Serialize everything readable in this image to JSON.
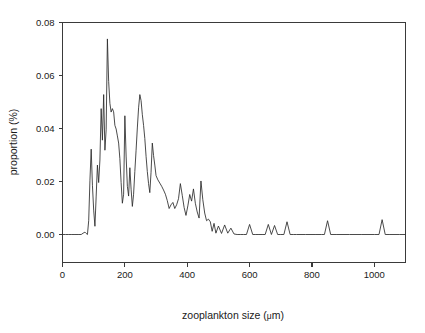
{
  "chart_data": {
    "type": "line",
    "title": "",
    "xlabel": "zooplankton size (μm)",
    "ylabel": "proportion (%)",
    "xlim": [
      0,
      1100
    ],
    "ylim": [
      0.0,
      0.08
    ],
    "grid": false,
    "legend": null,
    "x_ticks": [
      0,
      200,
      400,
      600,
      800,
      1000
    ],
    "x_tick_labels": [
      "0",
      "200",
      "400",
      "600",
      "800",
      "1000"
    ],
    "y_ticks": [
      0.0,
      0.02,
      0.04,
      0.06,
      0.08
    ],
    "y_tick_labels": [
      "0.00",
      "0.02",
      "0.04",
      "0.06",
      "0.08"
    ],
    "series": [
      {
        "name": "zooplankton size distribution",
        "color": "#2b2b2b",
        "x": [
          0,
          10,
          20,
          30,
          40,
          50,
          60,
          66,
          72,
          76,
          80,
          84,
          88,
          92,
          96,
          100,
          104,
          108,
          112,
          116,
          120,
          124,
          128,
          132,
          136,
          140,
          144,
          148,
          152,
          156,
          160,
          164,
          168,
          172,
          176,
          180,
          184,
          188,
          192,
          196,
          200,
          204,
          208,
          212,
          216,
          220,
          224,
          228,
          232,
          236,
          240,
          244,
          248,
          252,
          256,
          260,
          264,
          268,
          272,
          276,
          280,
          284,
          288,
          292,
          296,
          300,
          306,
          312,
          318,
          324,
          330,
          336,
          342,
          348,
          354,
          360,
          366,
          372,
          378,
          384,
          390,
          396,
          402,
          408,
          414,
          420,
          426,
          432,
          438,
          444,
          450,
          456,
          462,
          468,
          474,
          480,
          486,
          492,
          500,
          510,
          520,
          530,
          540,
          550,
          560,
          570,
          580,
          590,
          600,
          610,
          620,
          630,
          640,
          650,
          660,
          670,
          680,
          690,
          700,
          710,
          720,
          730,
          740,
          750,
          780,
          810,
          830,
          840,
          850,
          860,
          880,
          920,
          960,
          1000,
          1015,
          1025,
          1035,
          1050,
          1080,
          1100
        ],
        "y": [
          0.0,
          0.0,
          0.0,
          0.0,
          0.0,
          0.0,
          0.0,
          0.0005,
          0.0009,
          0.0004,
          0.0,
          0.0052,
          0.0205,
          0.0322,
          0.0186,
          0.0092,
          0.0031,
          0.0145,
          0.0262,
          0.0196,
          0.0281,
          0.0475,
          0.0356,
          0.0528,
          0.0318,
          0.0395,
          0.0738,
          0.0578,
          0.0495,
          0.0462,
          0.0475,
          0.0463,
          0.0412,
          0.0398,
          0.0372,
          0.0345,
          0.0286,
          0.0196,
          0.0118,
          0.0152,
          0.0448,
          0.0296,
          0.0182,
          0.0145,
          0.0252,
          0.0171,
          0.0106,
          0.0152,
          0.0238,
          0.0318,
          0.0402,
          0.0478,
          0.0528,
          0.0505,
          0.0452,
          0.0412,
          0.0362,
          0.0295,
          0.0238,
          0.0192,
          0.0158,
          0.0235,
          0.0345,
          0.0298,
          0.0262,
          0.0222,
          0.0206,
          0.0194,
          0.0182,
          0.0168,
          0.0152,
          0.0128,
          0.0098,
          0.0112,
          0.0121,
          0.0098,
          0.0112,
          0.0135,
          0.0192,
          0.0148,
          0.0102,
          0.0072,
          0.0108,
          0.0151,
          0.0126,
          0.0172,
          0.0118,
          0.0085,
          0.0062,
          0.0202,
          0.0131,
          0.0081,
          0.0052,
          0.0058,
          0.0048,
          0.0012,
          0.0042,
          0.0005,
          0.0032,
          0.0004,
          0.0036,
          0.0005,
          0.0024,
          0.0002,
          0.0,
          0.0,
          0.0,
          0.0,
          0.0038,
          0.0,
          0.0,
          0.0,
          0.0,
          0.0,
          0.0038,
          0.0,
          0.0034,
          0.0,
          0.0,
          0.0,
          0.0048,
          0.0,
          0.0,
          0.0,
          0.0,
          0.0,
          0.0,
          0.0,
          0.0052,
          0.0,
          0.0,
          0.0,
          0.0,
          0.0,
          0.0,
          0.0056,
          0.0,
          0.0,
          0.0,
          0.0
        ]
      }
    ]
  },
  "figure": {
    "background_color": "#ffffff",
    "axis_color": "#3a3a3a",
    "line_color": "#2b2b2b"
  }
}
